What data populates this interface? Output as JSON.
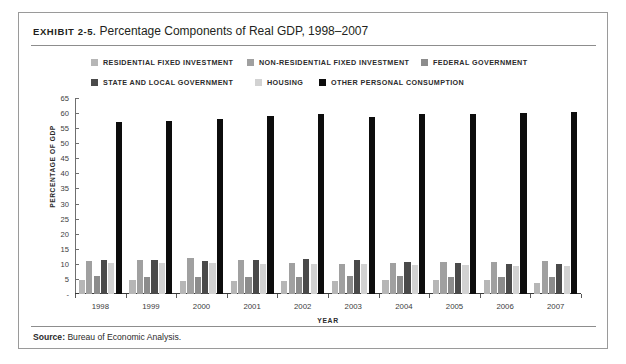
{
  "exhibit": {
    "label": "EXHIBIT 2-5.",
    "caption": "Percentage Components of Real GDP, 1998–2007",
    "source_label": "Source:",
    "source_text": "Bureau of Economic Analysis."
  },
  "colors": {
    "residential": "#b6b6b6",
    "non_residential": "#a0a0a0",
    "federal": "#8c8c8c",
    "state_local": "#4a4a4a",
    "housing": "#d2d2d2",
    "other_consumption": "#0d0d0d",
    "frame": "#9a9a9a",
    "axis": "#6f6f6f",
    "text": "#231f20"
  },
  "chart_data": {
    "type": "bar",
    "title": "Percentage Components of Real GDP, 1998–2007",
    "xlabel": "YEAR",
    "ylabel": "PERCENTAGE OF GDP",
    "ylim": [
      0,
      65
    ],
    "ytick_step": 5,
    "yticks": [
      65,
      60,
      55,
      50,
      45,
      40,
      35,
      30,
      25,
      20,
      15,
      10,
      5,
      "-"
    ],
    "grid": false,
    "legend_position": "top",
    "categories": [
      "1998",
      "1999",
      "2000",
      "2001",
      "2002",
      "2003",
      "2004",
      "2005",
      "2006",
      "2007"
    ],
    "series": [
      {
        "name": "RESIDENTIAL FIXED INVESTMENT",
        "color_key": "residential",
        "values": [
          4.5,
          4.5,
          4.4,
          4.3,
          4.3,
          4.4,
          4.7,
          4.8,
          4.6,
          3.5
        ]
      },
      {
        "name": "NON-RESIDENTIAL FIXED INVESTMENT",
        "color_key": "non_residential",
        "values": [
          11.1,
          11.4,
          12.0,
          11.4,
          10.4,
          10.1,
          10.3,
          10.5,
          10.7,
          10.8
        ]
      },
      {
        "name": "FEDERAL GOVERNMENT",
        "color_key": "federal",
        "values": [
          5.9,
          5.8,
          5.5,
          5.6,
          5.8,
          6.0,
          6.0,
          5.8,
          5.7,
          5.6
        ]
      },
      {
        "name": "STATE AND LOCAL GOVERNMENT",
        "color_key": "state_local",
        "values": [
          11.2,
          11.3,
          11.1,
          11.3,
          11.5,
          11.3,
          10.7,
          10.3,
          10.1,
          10.0
        ]
      },
      {
        "name": "HOUSING",
        "color_key": "housing",
        "values": [
          10.4,
          10.2,
          10.2,
          10.1,
          10.0,
          9.8,
          9.7,
          9.6,
          9.4,
          9.3
        ]
      },
      {
        "name": "OTHER PERSONAL CONSUMPTION",
        "color_key": "other_consumption",
        "values": [
          57.0,
          57.3,
          58.0,
          58.9,
          59.6,
          58.8,
          59.7,
          59.8,
          59.9,
          60.4
        ]
      }
    ]
  }
}
